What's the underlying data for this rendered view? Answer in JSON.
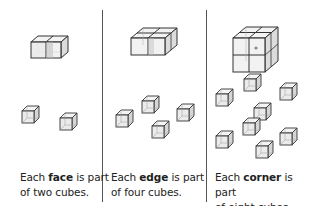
{
  "panels": [
    {
      "caption_pre": "Each ",
      "caption_bold": "face",
      "caption_post": " is part",
      "caption_line2": "of two cubes.",
      "assembly": "1x2x1 block of two cubes",
      "small_cubes": 2
    },
    {
      "caption_pre": "Each ",
      "caption_bold": "edge",
      "caption_post": " is part",
      "caption_line2": "of four cubes.",
      "assembly": "2x2x1 block of four cubes",
      "small_cubes": 4
    },
    {
      "caption_pre": "Each ",
      "caption_bold": "corner",
      "caption_post": " is part",
      "caption_line2": "of eight cubes.",
      "assembly": "2x2x2 block of eight cubes",
      "small_cubes": 8
    }
  ],
  "colors": {
    "line": "#333333",
    "face_light": "#f2f2f2",
    "face_mid": "#dcdcdc",
    "face_dark": "#c4c4c4",
    "marker": "#8a8a8a",
    "divider": "#555555"
  }
}
